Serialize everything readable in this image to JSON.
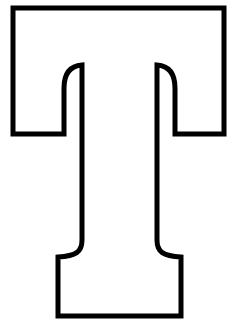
{
  "figure": {
    "letter": "T",
    "style": "outline",
    "stroke_color": "#000000",
    "fill_color": "#ffffff",
    "background": "#ffffff"
  }
}
